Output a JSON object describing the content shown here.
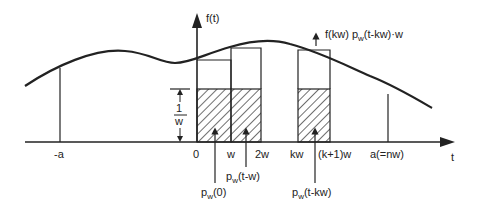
{
  "figure": {
    "y_axis_label": "f(t)",
    "x_axis_label": "t",
    "ticks": [
      {
        "id": "neg-a",
        "label": "-a",
        "x": 60
      },
      {
        "id": "zero",
        "label": "0",
        "x": 197
      },
      {
        "id": "w",
        "label": "w",
        "x": 231
      },
      {
        "id": "two-w",
        "label": "2w",
        "x": 261
      },
      {
        "id": "kw",
        "label": "kw",
        "x": 298
      },
      {
        "id": "k-plus-1-w",
        "label": "(k+1)w",
        "x": 330
      },
      {
        "id": "a-eq-nw",
        "label": "a(=nw)",
        "x": 388
      }
    ],
    "height_annotation": {
      "numerator": "1",
      "denominator": "w"
    },
    "pulse_labels": {
      "p0": {
        "main": "p",
        "sub": "w",
        "arg": "(0)"
      },
      "p1": {
        "main": "p",
        "sub": "w",
        "arg": "(t-w)"
      },
      "pk": {
        "main": "p",
        "sub": "w",
        "arg": "(t-kw)"
      }
    },
    "weighted_pulse_label": {
      "prefix": "f(kw) ",
      "main": "p",
      "sub": "w",
      "suffix": "(t-kw)·w"
    },
    "colors": {
      "ink": "#222222",
      "background": "#ffffff"
    }
  }
}
